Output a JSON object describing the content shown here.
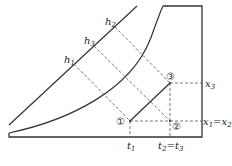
{
  "diagram": {
    "type": "psychrometric-chart",
    "colors": {
      "line": "#333333",
      "dashed": "#555555",
      "background": "#ffffff"
    },
    "enthalpy_labels": [
      {
        "id": "h1",
        "base": "h",
        "sub": "1"
      },
      {
        "id": "h3",
        "base": "h",
        "sub": "3"
      },
      {
        "id": "h2",
        "base": "h",
        "sub": "2"
      }
    ],
    "state_points": [
      {
        "id": "1",
        "symbol": "①"
      },
      {
        "id": "2",
        "symbol": "②"
      },
      {
        "id": "3",
        "symbol": "③"
      }
    ],
    "y_axis_labels": {
      "x3": {
        "base": "x",
        "sub": "3"
      },
      "x1x2": {
        "base1": "x",
        "sub1": "1",
        "eq": "=",
        "base2": "x",
        "sub2": "2"
      }
    },
    "x_axis_labels": {
      "t1": {
        "base": "t",
        "sub": "1"
      },
      "t2t3": {
        "base1": "t",
        "sub1": "2",
        "eq": "=",
        "base2": "t",
        "sub2": "3"
      }
    }
  }
}
